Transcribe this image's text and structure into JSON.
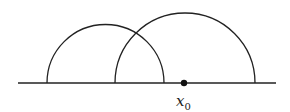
{
  "diagram": {
    "baseline": {
      "x1": 18,
      "x2": 276,
      "y": 83
    },
    "arcs": [
      {
        "name": "left-semicircle",
        "cx": 105.5,
        "cy": 83,
        "r": 58.5
      },
      {
        "name": "right-semicircle",
        "cx": 185,
        "cy": 83,
        "r": 70
      }
    ],
    "point": {
      "cx": 184,
      "cy": 83,
      "r": 3.2
    },
    "label": {
      "base": "x",
      "sub": "0"
    },
    "colors": {
      "stroke": "#222222",
      "background": "#ffffff"
    }
  }
}
